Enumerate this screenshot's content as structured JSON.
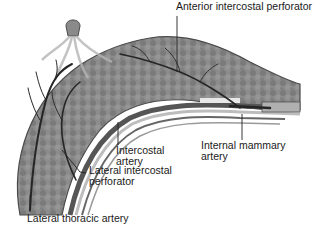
{
  "figure": {
    "colors": {
      "tissue": "#8a8a8a",
      "tissue_dark": "#6e6e6e",
      "vessel": "#2b2b2b",
      "outline": "#4a4a4a",
      "rib_light": "#d8d8d8",
      "background": "#ffffff"
    }
  },
  "labels": {
    "anterior_intercostal_perforator": "Anterior intercostal perforator",
    "intercostal_artery": [
      "Intercostal",
      "artery"
    ],
    "internal_mammary_artery": [
      "Internal mammary",
      "artery"
    ],
    "lateral_intercostal_perforator": [
      "Lateral intercostal",
      "perforator"
    ],
    "lateral_thoracic_artery": "Lateral thoracic artery"
  }
}
